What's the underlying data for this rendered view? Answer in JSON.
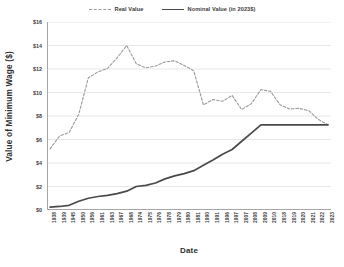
{
  "chart_data": {
    "type": "line",
    "title": "",
    "xlabel": "Date",
    "ylabel": "Value of Minimum Wage ($)",
    "ylim": [
      0,
      16
    ],
    "ytick_labels": [
      "$0",
      "$2",
      "$4",
      "$6",
      "$8",
      "$10",
      "$12",
      "$14",
      "$16"
    ],
    "ytick_values": [
      0,
      2,
      4,
      6,
      8,
      10,
      12,
      14,
      16
    ],
    "grid": "horizontal",
    "legend_position": "top-center",
    "categories": [
      "1938",
      "1939",
      "1945",
      "1950",
      "1956",
      "1961",
      "1963",
      "1967",
      "1968",
      "1974",
      "1975",
      "1976",
      "1978",
      "1979",
      "1980",
      "1981",
      "1990",
      "1991",
      "1996",
      "1997",
      "2007",
      "2008",
      "2009",
      "2010",
      "2018",
      "2019",
      "2020",
      "2021",
      "2022",
      "2023"
    ],
    "series": [
      {
        "name": "Real Value",
        "style": "dashed",
        "color": "#9b9b9b",
        "values": [
          5.2,
          6.3,
          6.6,
          8.15,
          11.25,
          11.75,
          12.05,
          12.95,
          14.0,
          12.45,
          12.1,
          12.25,
          12.6,
          12.7,
          12.3,
          11.85,
          8.95,
          9.4,
          9.25,
          9.75,
          8.55,
          9.05,
          10.25,
          10.1,
          8.95,
          8.6,
          8.65,
          8.45,
          7.7,
          7.25
        ]
      },
      {
        "name": "Nominal Value (in 2023$)",
        "style": "solid",
        "color": "#4a4a4a",
        "values": [
          0.25,
          0.3,
          0.4,
          0.75,
          1.0,
          1.15,
          1.25,
          1.4,
          1.6,
          2.0,
          2.1,
          2.3,
          2.65,
          2.9,
          3.1,
          3.35,
          3.8,
          4.25,
          4.75,
          5.15,
          5.85,
          6.55,
          7.25,
          7.25,
          7.25,
          7.25,
          7.25,
          7.25,
          7.25,
          7.25
        ]
      }
    ]
  },
  "legend": {
    "items": [
      {
        "label": "Real Value",
        "style": "dashed"
      },
      {
        "label": "Nominal Value (in 2023$)",
        "style": "solid"
      }
    ]
  },
  "axes": {
    "y_title": "Value of Minimum Wage ($)",
    "x_title": "Date"
  },
  "colors": {
    "real": "#9b9b9b",
    "nominal": "#4a4a4a",
    "grid": "#dcdcdc",
    "axis": "#a6a6a6",
    "text": "#3d3d3d",
    "background": "#ffffff"
  }
}
